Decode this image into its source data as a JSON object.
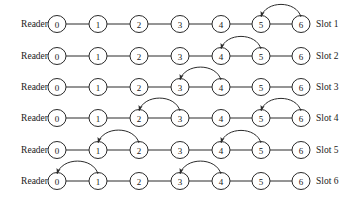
{
  "figure": {
    "type": "diagram",
    "node_labels": [
      "0",
      "1",
      "2",
      "3",
      "4",
      "5",
      "6"
    ],
    "left_label": "Reader",
    "colors": {
      "stroke": "#2b2b2b",
      "node_fill": "#ffffff",
      "background": "#ffffff",
      "text": "#1a1a1a"
    },
    "geometry": {
      "node_x": [
        57,
        98,
        139,
        180,
        221,
        261,
        301
      ],
      "row_y": [
        24,
        56,
        87,
        118,
        150,
        181
      ],
      "node_rx": 9,
      "node_ry": 8.5,
      "left_label_x": 48,
      "right_label_x": 316
    }
  },
  "rows": [
    {
      "left_label": "Reader",
      "right_label": "Slot 1",
      "nodes": [
        "0",
        "1",
        "2",
        "3",
        "4",
        "5",
        "6"
      ],
      "arcs": [
        {
          "from": 6,
          "to": 5
        }
      ]
    },
    {
      "left_label": "Reader",
      "right_label": "Slot 2",
      "nodes": [
        "0",
        "1",
        "2",
        "3",
        "4",
        "5",
        "6"
      ],
      "arcs": [
        {
          "from": 5,
          "to": 4
        }
      ]
    },
    {
      "left_label": "Reader",
      "right_label": "Slot 3",
      "nodes": [
        "0",
        "1",
        "2",
        "3",
        "4",
        "5",
        "6"
      ],
      "arcs": [
        {
          "from": 4,
          "to": 3
        }
      ]
    },
    {
      "left_label": "Reader",
      "right_label": "Slot 4",
      "nodes": [
        "0",
        "1",
        "2",
        "3",
        "4",
        "5",
        "6"
      ],
      "arcs": [
        {
          "from": 3,
          "to": 2
        },
        {
          "from": 6,
          "to": 5
        }
      ]
    },
    {
      "left_label": "Reader",
      "right_label": "Slot 5",
      "nodes": [
        "0",
        "1",
        "2",
        "3",
        "4",
        "5",
        "6"
      ],
      "arcs": [
        {
          "from": 2,
          "to": 1
        },
        {
          "from": 5,
          "to": 4
        }
      ]
    },
    {
      "left_label": "Reader",
      "right_label": "Slot 6",
      "nodes": [
        "0",
        "1",
        "2",
        "3",
        "4",
        "5",
        "6"
      ],
      "arcs": [
        {
          "from": 1,
          "to": 0
        },
        {
          "from": 4,
          "to": 3
        }
      ]
    }
  ]
}
